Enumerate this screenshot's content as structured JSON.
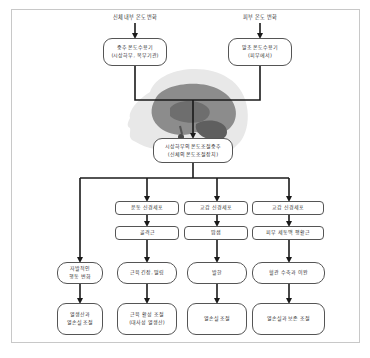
{
  "diagram": {
    "title": "",
    "inputs": {
      "internal_label": "신체 내부 온도 변화",
      "external_label": "피부 온도 변화"
    },
    "receptors": {
      "central": {
        "line1": "중추 온도수용기",
        "line2": "(시상하부, 복부기관)"
      },
      "peripheral": {
        "line1": "말초 온도수용기",
        "line2": "(피부에서)"
      }
    },
    "center": {
      "line1": "시상하부의 온도조절중추",
      "line2": "(신체의 온도조절장치)"
    },
    "columns": [
      {
        "steps": [],
        "response": {
          "line1": "자발적인",
          "line2": "행동 변화"
        },
        "outcome": {
          "line1": "열생산과",
          "line2": "열손실 조절"
        }
      },
      {
        "steps": [
          "운동 신경세포",
          "골격근"
        ],
        "response": {
          "line1": "근육 긴장, 떨림",
          "line2": ""
        },
        "outcome": {
          "line1": "근육 활성 조절",
          "line2": "(대사성 열생산)"
        }
      },
      {
        "steps": [
          "교감 신경세포",
          "땀샘"
        ],
        "response": {
          "line1": "발한",
          "line2": ""
        },
        "outcome": {
          "line1": "열손실 조절",
          "line2": ""
        }
      },
      {
        "steps": [
          "교감 신경세포",
          "피부 세동맥 평활근"
        ],
        "response": {
          "line1": "혈관 수축과 이완",
          "line2": ""
        },
        "outcome": {
          "line1": "열손실과 보존 조절",
          "line2": ""
        }
      }
    ],
    "colors": {
      "line": "#1a1a1a",
      "box_border": "#555555",
      "frame_border": "#c8c8c8",
      "head_skin": "#e6e6e6",
      "brain_outer": "#8a8a8a",
      "brain_inner": "#6b6b6b"
    }
  }
}
